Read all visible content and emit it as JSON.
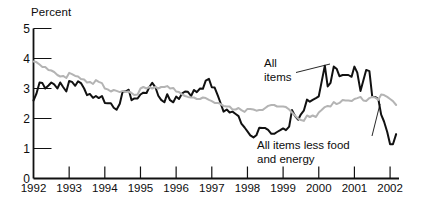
{
  "chart_data": {
    "type": "line",
    "title": "",
    "ylabel": "Percent",
    "xlabel": "",
    "ylim": [
      0,
      5
    ],
    "yticks": [
      0,
      1,
      2,
      3,
      4,
      5
    ],
    "xlim": [
      1992,
      2002.25
    ],
    "xticks": [
      1992,
      1993,
      1994,
      1995,
      1996,
      1997,
      1998,
      1999,
      2000,
      2001,
      2002
    ],
    "xtick_labels": [
      "1992",
      "1993",
      "1994",
      "1995",
      "1996",
      "1997",
      "1998",
      "1999",
      "2000",
      "2001",
      "2002"
    ],
    "grid": false,
    "legend_position": "inline-annotations",
    "annotations": [
      {
        "id": "all-items",
        "text": "All\nitems",
        "line1": "All",
        "line2": "items",
        "points_to": "black-series"
      },
      {
        "id": "core",
        "text": "All items less food\nand energy",
        "line1": "All items less food",
        "line2": "and energy",
        "points_to": "gray-series"
      }
    ],
    "series": [
      {
        "name": "All items",
        "color": "#111111",
        "width": 2.0,
        "x": [
          1992.0,
          1992.08,
          1992.17,
          1992.25,
          1992.33,
          1992.42,
          1992.5,
          1992.58,
          1992.67,
          1992.75,
          1992.83,
          1992.92,
          1993.0,
          1993.08,
          1993.17,
          1993.25,
          1993.33,
          1993.42,
          1993.5,
          1993.58,
          1993.67,
          1993.75,
          1993.83,
          1993.92,
          1994.0,
          1994.08,
          1994.17,
          1994.25,
          1994.33,
          1994.42,
          1994.5,
          1994.58,
          1994.67,
          1994.75,
          1994.83,
          1994.92,
          1995.0,
          1995.08,
          1995.17,
          1995.25,
          1995.33,
          1995.42,
          1995.5,
          1995.58,
          1995.67,
          1995.75,
          1995.83,
          1995.92,
          1996.0,
          1996.08,
          1996.17,
          1996.25,
          1996.33,
          1996.42,
          1996.5,
          1996.58,
          1996.67,
          1996.75,
          1996.83,
          1996.92,
          1997.0,
          1997.08,
          1997.17,
          1997.25,
          1997.33,
          1997.42,
          1997.5,
          1997.58,
          1997.67,
          1997.75,
          1997.83,
          1997.92,
          1998.0,
          1998.08,
          1998.17,
          1998.25,
          1998.33,
          1998.42,
          1998.5,
          1998.58,
          1998.67,
          1998.75,
          1998.83,
          1998.92,
          1999.0,
          1999.08,
          1999.17,
          1999.25,
          1999.33,
          1999.42,
          1999.5,
          1999.58,
          1999.67,
          1999.75,
          1999.83,
          1999.92,
          2000.0,
          2000.08,
          2000.17,
          2000.25,
          2000.33,
          2000.42,
          2000.5,
          2000.58,
          2000.67,
          2000.75,
          2000.83,
          2000.92,
          2001.0,
          2001.08,
          2001.17,
          2001.25,
          2001.33,
          2001.42,
          2001.5,
          2001.58,
          2001.67,
          2001.75,
          2001.83,
          2001.92,
          2002.0,
          2002.08,
          2002.17
        ],
        "values": [
          2.6,
          2.82,
          3.2,
          3.18,
          3.0,
          3.1,
          3.2,
          3.14,
          3.0,
          3.2,
          3.05,
          2.9,
          3.25,
          3.22,
          3.09,
          3.24,
          3.18,
          3.0,
          2.78,
          2.82,
          2.69,
          2.75,
          2.68,
          2.75,
          2.52,
          2.51,
          2.51,
          2.36,
          2.29,
          2.49,
          2.9,
          2.9,
          2.96,
          2.61,
          2.67,
          2.67,
          2.8,
          2.86,
          2.85,
          3.05,
          3.19,
          3.04,
          2.76,
          2.62,
          2.54,
          2.81,
          2.61,
          2.54,
          2.73,
          2.65,
          2.84,
          2.9,
          2.89,
          2.75,
          2.95,
          2.88,
          3.0,
          2.99,
          3.26,
          3.32,
          3.04,
          3.03,
          2.76,
          2.5,
          2.23,
          2.3,
          2.2,
          2.23,
          2.15,
          2.08,
          1.83,
          1.7,
          1.57,
          1.44,
          1.37,
          1.44,
          1.69,
          1.68,
          1.68,
          1.62,
          1.49,
          1.49,
          1.55,
          1.61,
          1.67,
          1.61,
          1.73,
          2.28,
          2.09,
          1.96,
          2.14,
          2.26,
          2.63,
          2.56,
          2.62,
          2.68,
          2.74,
          3.22,
          3.76,
          3.07,
          3.19,
          3.73,
          3.66,
          3.41,
          3.45,
          3.45,
          3.45,
          3.39,
          3.73,
          3.53,
          2.92,
          3.27,
          3.62,
          3.58,
          2.72,
          2.72,
          2.65,
          2.13,
          1.9,
          1.55,
          1.14,
          1.14,
          1.48
        ]
      },
      {
        "name": "All items less food and energy",
        "color": "#b4b4b4",
        "width": 2.0,
        "x": [
          1992.0,
          1992.08,
          1992.17,
          1992.25,
          1992.33,
          1992.42,
          1992.5,
          1992.58,
          1992.67,
          1992.75,
          1992.83,
          1992.92,
          1993.0,
          1993.08,
          1993.17,
          1993.25,
          1993.33,
          1993.42,
          1993.5,
          1993.58,
          1993.67,
          1993.75,
          1993.83,
          1993.92,
          1994.0,
          1994.08,
          1994.17,
          1994.25,
          1994.33,
          1994.42,
          1994.5,
          1994.58,
          1994.67,
          1994.75,
          1994.83,
          1994.92,
          1995.0,
          1995.08,
          1995.17,
          1995.25,
          1995.33,
          1995.42,
          1995.5,
          1995.58,
          1995.67,
          1995.75,
          1995.83,
          1995.92,
          1996.0,
          1996.08,
          1996.17,
          1996.25,
          1996.33,
          1996.42,
          1996.5,
          1996.58,
          1996.67,
          1996.75,
          1996.83,
          1996.92,
          1997.0,
          1997.08,
          1997.17,
          1997.25,
          1997.33,
          1997.42,
          1997.5,
          1997.58,
          1997.67,
          1997.75,
          1997.83,
          1997.92,
          1998.0,
          1998.08,
          1998.17,
          1998.25,
          1998.33,
          1998.42,
          1998.5,
          1998.58,
          1998.67,
          1998.75,
          1998.83,
          1998.92,
          1999.0,
          1999.08,
          1999.17,
          1999.25,
          1999.33,
          1999.42,
          1999.5,
          1999.58,
          1999.67,
          1999.75,
          1999.83,
          1999.92,
          2000.0,
          2000.08,
          2000.17,
          2000.25,
          2000.33,
          2000.42,
          2000.5,
          2000.58,
          2000.67,
          2000.75,
          2000.83,
          2000.92,
          2001.0,
          2001.08,
          2001.17,
          2001.25,
          2001.33,
          2001.42,
          2001.5,
          2001.58,
          2001.67,
          2001.75,
          2001.83,
          2001.92,
          2002.0,
          2002.08,
          2002.17
        ],
        "values": [
          3.9,
          3.88,
          3.8,
          3.72,
          3.72,
          3.62,
          3.6,
          3.55,
          3.45,
          3.4,
          3.42,
          3.35,
          3.52,
          3.48,
          3.42,
          3.4,
          3.32,
          3.3,
          3.2,
          3.22,
          3.15,
          3.28,
          3.22,
          3.18,
          3.0,
          2.97,
          2.9,
          2.95,
          2.92,
          2.88,
          2.92,
          2.88,
          2.9,
          2.85,
          2.78,
          2.8,
          3.0,
          3.05,
          3.0,
          3.05,
          3.0,
          3.05,
          3.0,
          3.05,
          3.05,
          3.08,
          3.0,
          3.02,
          2.9,
          2.88,
          2.8,
          2.75,
          2.72,
          2.7,
          2.7,
          2.65,
          2.65,
          2.7,
          2.68,
          2.62,
          2.58,
          2.52,
          2.52,
          2.48,
          2.42,
          2.4,
          2.4,
          2.3,
          2.3,
          2.35,
          2.28,
          2.22,
          2.32,
          2.32,
          2.3,
          2.26,
          2.28,
          2.28,
          2.35,
          2.42,
          2.45,
          2.45,
          2.4,
          2.4,
          2.4,
          2.38,
          2.3,
          2.2,
          2.1,
          2.0,
          1.95,
          1.92,
          2.1,
          2.05,
          2.1,
          2.05,
          2.2,
          2.28,
          2.38,
          2.42,
          2.4,
          2.55,
          2.48,
          2.52,
          2.62,
          2.6,
          2.6,
          2.58,
          2.65,
          2.68,
          2.72,
          2.6,
          2.58,
          2.68,
          2.72,
          2.7,
          2.62,
          2.8,
          2.78,
          2.72,
          2.65,
          2.58,
          2.45
        ]
      }
    ]
  }
}
